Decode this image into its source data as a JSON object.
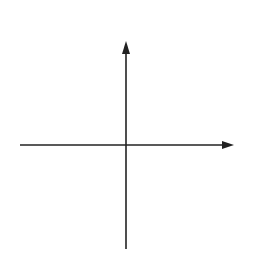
{
  "chart_data": {
    "type": "scatter",
    "title": "",
    "xlabel": "x",
    "ylabel": "y",
    "xlim": [
      -5,
      5
    ],
    "ylim": [
      -5,
      5
    ],
    "grid": true,
    "x_ticks": [
      -4,
      -3,
      -2,
      -1,
      1,
      2,
      3,
      4
    ],
    "y_ticks": [
      4,
      3,
      2,
      1,
      -1,
      -2,
      -3,
      -4
    ],
    "x_tick_labels": [
      "−4",
      "−3",
      "−2",
      "−1",
      "1",
      "2",
      "3",
      "4"
    ],
    "y_tick_labels": [
      "4",
      "3",
      "2",
      "1",
      "−1",
      "−2",
      "−3",
      "−4"
    ],
    "series": []
  },
  "colors": {
    "grid": "#c8c8c8",
    "axis": "#222222"
  }
}
